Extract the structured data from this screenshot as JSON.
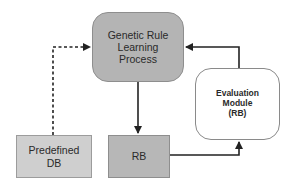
{
  "diagram": {
    "nodes": {
      "main": {
        "label": "Genetic Rule\nLearning\nProcess",
        "shape": "rounded-rect",
        "fill": "#b4b4b4"
      },
      "predefined_db": {
        "label": "Predefined\nDB",
        "shape": "rect",
        "fill": "#cfcfcf"
      },
      "rb": {
        "label": "RB",
        "shape": "rect",
        "fill": "#b7b7b7"
      },
      "evaluation": {
        "label": "Evaluation\nModule\n(RB)",
        "shape": "rounded-rect",
        "fill": "#ffffff"
      }
    },
    "edges": [
      {
        "from": "predefined_db",
        "to": "main",
        "style": "dashed"
      },
      {
        "from": "main",
        "to": "rb",
        "style": "solid"
      },
      {
        "from": "rb",
        "to": "evaluation",
        "style": "solid"
      },
      {
        "from": "evaluation",
        "to": "main",
        "style": "solid"
      }
    ],
    "colors": {
      "line": "#222222",
      "text": "#2a2a2a"
    }
  }
}
